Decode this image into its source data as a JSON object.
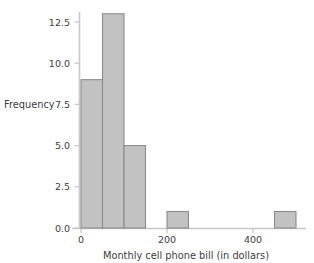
{
  "chart_data": {
    "type": "bar",
    "title": "",
    "subtitle": "",
    "xlabel": "Monthly cell phone bill (in dollars)",
    "ylabel": "Frequency",
    "bin_width": 50,
    "bin_edges": [
      0,
      50,
      100,
      150,
      200,
      250,
      300,
      350,
      400,
      450,
      500
    ],
    "categories": [
      "0-50",
      "50-100",
      "100-150",
      "150-200",
      "200-250",
      "250-300",
      "300-350",
      "350-400",
      "400-450",
      "450-500"
    ],
    "values": [
      9,
      13,
      5,
      0,
      1,
      0,
      0,
      0,
      0,
      1
    ],
    "bars": [
      {
        "x0": 0,
        "x1": 50,
        "height": 9
      },
      {
        "x0": 50,
        "x1": 100,
        "height": 13
      },
      {
        "x0": 100,
        "x1": 150,
        "height": 5
      },
      {
        "x0": 200,
        "x1": 250,
        "height": 1
      },
      {
        "x0": 450,
        "x1": 500,
        "height": 1
      }
    ],
    "xlim": [
      -18,
      540
    ],
    "ylim": [
      0,
      13.8
    ],
    "xticks": [
      0,
      200,
      400
    ],
    "xticklabels": [
      "0",
      "200",
      "400"
    ],
    "yticks": [
      0.0,
      2.5,
      5.0,
      7.5,
      10.0,
      12.5
    ],
    "yticklabels": [
      "0.0",
      "2.5",
      "5.0",
      "7.5",
      "10.0",
      "12.5"
    ],
    "grid": false,
    "legend": null,
    "colors": {
      "bar_fill": "#c2c2c2",
      "bar_edge": "#8c8c8c",
      "axis": "#c8c8c8",
      "text": "#3d3d3d",
      "background": "#ffffff"
    }
  },
  "axis_labels": {
    "x_title": "Monthly cell phone bill (in dollars)",
    "y_title": "Frequency"
  },
  "ytick_text": {
    "t0": "0.0",
    "t1": "2.5",
    "t2": "5.0",
    "t3": "7.5",
    "t4": "10.0",
    "t5": "12.5"
  },
  "xtick_text": {
    "t0": "0",
    "t1": "200",
    "t2": "400"
  }
}
